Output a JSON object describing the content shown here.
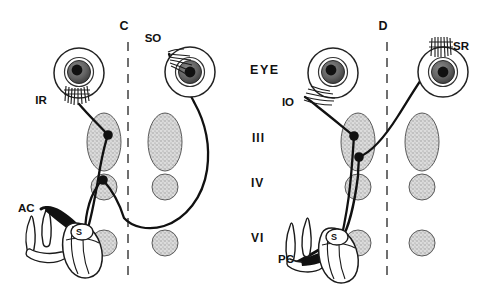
{
  "figure": {
    "background": "#ffffff",
    "ink": "#111111",
    "nucleus_fill": "#cfcfcf",
    "nucleus_stroke": "#4a4a4a",
    "width": 484,
    "height": 301
  },
  "panels": [
    {
      "id": "panel-c",
      "midline_label": "C",
      "midline_x": 128,
      "description": "Anterior canal (AC) pathway to ipsilateral inferior rectus and contralateral superior oblique"
    },
    {
      "id": "panel-d",
      "midline_label": "D",
      "midline_x": 387,
      "description": "Posterior canal (PC) pathway to ipsilateral inferior oblique and contralateral superior rectus"
    }
  ],
  "row_labels": [
    {
      "key": "eye",
      "text": "EYE",
      "x": 250,
      "y": 74
    },
    {
      "key": "iii",
      "text": "III",
      "x": 252,
      "y": 142
    },
    {
      "key": "iv",
      "text": "IV",
      "x": 251,
      "y": 187
    },
    {
      "key": "vi",
      "text": "VI",
      "x": 251,
      "y": 242
    }
  ],
  "midline_labels": [
    {
      "key": "c",
      "text": "C",
      "x": 124,
      "y": 30
    },
    {
      "key": "d",
      "text": "D",
      "x": 383,
      "y": 30
    }
  ],
  "muscle_labels": [
    {
      "key": "ir",
      "text": "IR",
      "x": 41,
      "y": 104,
      "full": "inferior rectus",
      "panel": "panel-c"
    },
    {
      "key": "so",
      "text": "SO",
      "x": 153,
      "y": 42,
      "full": "superior oblique",
      "panel": "panel-c"
    },
    {
      "key": "io",
      "text": "IO",
      "x": 288,
      "y": 106,
      "full": "inferior oblique",
      "panel": "panel-d"
    },
    {
      "key": "sr",
      "text": "SR",
      "x": 453,
      "y": 50,
      "full": "superior rectus",
      "panel": "panel-d"
    }
  ],
  "canal_labels": [
    {
      "key": "ac",
      "text": "AC",
      "x": 18,
      "y": 212,
      "full": "anterior canal",
      "panel": "panel-c"
    },
    {
      "key": "pc",
      "text": "PC",
      "x": 278,
      "y": 263,
      "full": "posterior canal",
      "panel": "panel-d"
    }
  ],
  "nucleus_labels": [
    {
      "key": "s-left",
      "text": "S",
      "x": 79,
      "y": 231,
      "full": "superior vestibular nucleus",
      "panel": "panel-c"
    },
    {
      "key": "s-right",
      "text": "S",
      "x": 334,
      "y": 236,
      "full": "superior vestibular nucleus",
      "panel": "panel-d"
    }
  ],
  "nuclei": [
    {
      "key": "iii-left-c",
      "shape": "ellipse",
      "cx": 104,
      "cy": 142,
      "rx": 17,
      "ry": 29,
      "panel": "panel-c",
      "level": "III"
    },
    {
      "key": "iii-right-c",
      "shape": "ellipse",
      "cx": 165,
      "cy": 142,
      "rx": 17,
      "ry": 29,
      "panel": "panel-c",
      "level": "III"
    },
    {
      "key": "iv-left-c",
      "shape": "circle",
      "cx": 104,
      "cy": 187,
      "rx": 13,
      "ry": 13,
      "panel": "panel-c",
      "level": "IV"
    },
    {
      "key": "iv-right-c",
      "shape": "circle",
      "cx": 165,
      "cy": 187,
      "rx": 13,
      "ry": 13,
      "panel": "panel-c",
      "level": "IV"
    },
    {
      "key": "vi-left-c",
      "shape": "circle",
      "cx": 104,
      "cy": 243,
      "rx": 13,
      "ry": 13,
      "panel": "panel-c",
      "level": "VI"
    },
    {
      "key": "vi-right-c",
      "shape": "circle",
      "cx": 165,
      "cy": 243,
      "rx": 13,
      "ry": 13,
      "panel": "panel-c",
      "level": "VI"
    },
    {
      "key": "iii-left-d",
      "shape": "ellipse",
      "cx": 358,
      "cy": 142,
      "rx": 17,
      "ry": 29,
      "panel": "panel-d",
      "level": "III"
    },
    {
      "key": "iii-right-d",
      "shape": "ellipse",
      "cx": 422,
      "cy": 142,
      "rx": 17,
      "ry": 29,
      "panel": "panel-d",
      "level": "III"
    },
    {
      "key": "iv-left-d",
      "shape": "circle",
      "cx": 358,
      "cy": 187,
      "rx": 13,
      "ry": 13,
      "panel": "panel-d",
      "level": "IV"
    },
    {
      "key": "iv-right-d",
      "shape": "circle",
      "cx": 422,
      "cy": 187,
      "rx": 13,
      "ry": 13,
      "panel": "panel-d",
      "level": "IV"
    },
    {
      "key": "vi-left-d",
      "shape": "circle",
      "cx": 358,
      "cy": 243,
      "rx": 13,
      "ry": 13,
      "panel": "panel-d",
      "level": "VI"
    },
    {
      "key": "vi-right-d",
      "shape": "circle",
      "cx": 422,
      "cy": 243,
      "rx": 13,
      "ry": 13,
      "panel": "panel-d",
      "level": "VI"
    }
  ],
  "eyes": [
    {
      "key": "eye-left-c",
      "cx": 79,
      "cy": 73,
      "r": 25,
      "panel": "panel-c"
    },
    {
      "key": "eye-right-c",
      "cx": 190,
      "cy": 72,
      "r": 25,
      "panel": "panel-c"
    },
    {
      "key": "eye-left-d",
      "cx": 333,
      "cy": 73,
      "r": 25,
      "panel": "panel-d"
    },
    {
      "key": "eye-right-d",
      "cx": 443,
      "cy": 72,
      "r": 25,
      "panel": "panel-d"
    }
  ],
  "synapses": [
    {
      "key": "syn-ir",
      "cx": 108,
      "cy": 135,
      "r": 4.6,
      "panel": "panel-c"
    },
    {
      "key": "syn-iv-c",
      "cx": 103,
      "cy": 180,
      "r": 4.6,
      "panel": "panel-c"
    },
    {
      "key": "syn-s-c",
      "cx": 86,
      "cy": 234,
      "r": 4.6,
      "panel": "panel-c"
    },
    {
      "key": "syn-io-d",
      "cx": 354,
      "cy": 135,
      "r": 4.6,
      "panel": "panel-d"
    },
    {
      "key": "syn-iii-d",
      "cx": 359,
      "cy": 157,
      "r": 4.6,
      "panel": "panel-d"
    },
    {
      "key": "syn-s-d",
      "cx": 341,
      "cy": 240,
      "r": 4.6,
      "panel": "panel-d"
    }
  ]
}
